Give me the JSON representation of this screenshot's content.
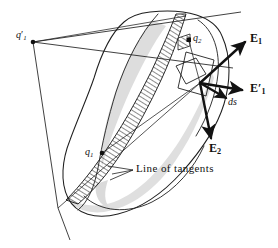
{
  "figure": {
    "kind": "geometric-diagram",
    "caption_text": "Line of tangents",
    "background_color": "#ffffff",
    "ink_color": "#1a1a1a",
    "shade_color": "#cccccc",
    "hatch_color": "#2a2a2a",
    "width": 278,
    "height": 248
  },
  "points": [
    {
      "id": "q1prime",
      "base": "q",
      "subscript": "1",
      "prime": "′",
      "label": "q′1",
      "x": 30,
      "y": 36,
      "marker": "filled-dot",
      "marker_x": 32,
      "marker_y": 42
    },
    {
      "id": "q2",
      "base": "q",
      "subscript": "2",
      "prime": "",
      "label": "q2",
      "x": 196,
      "y": 38,
      "marker": "filled-square",
      "marker_x": 189,
      "marker_y": 40
    },
    {
      "id": "q1",
      "base": "q",
      "subscript": "1",
      "prime": "",
      "label": "q1",
      "x": 88,
      "y": 150,
      "marker": "filled-dot",
      "marker_x": 102,
      "marker_y": 153
    }
  ],
  "vectors": [
    {
      "id": "E1",
      "base": "E",
      "subscript": "1",
      "prime": "",
      "label": "E1",
      "label_x": 252,
      "label_y": 38,
      "from_x": 200,
      "from_y": 83,
      "to_x": 247,
      "to_y": 43
    },
    {
      "id": "E1prime",
      "base": "E",
      "subscript": "1",
      "prime": "′",
      "label": "E′1",
      "label_x": 252,
      "label_y": 88,
      "from_x": 200,
      "from_y": 83,
      "to_x": 244,
      "to_y": 91
    },
    {
      "id": "ds",
      "base": "ds",
      "subscript": "",
      "prime": "",
      "label": "ds",
      "label_x": 231,
      "label_y": 103,
      "from_x": 200,
      "from_y": 83,
      "to_x": 228,
      "to_y": 99
    },
    {
      "id": "E2",
      "base": "E",
      "subscript": "2",
      "prime": "",
      "label": "E2",
      "label_x": 212,
      "label_y": 148,
      "from_x": 200,
      "from_y": 83,
      "to_x": 212,
      "to_y": 140
    }
  ],
  "annotations": [
    {
      "id": "line-of-tangents",
      "text": "Line of tangents",
      "x": 136,
      "y": 166,
      "leader_from_x": 133,
      "leader_from_y": 170,
      "leader_to_x": 112,
      "leader_to_y": 174
    }
  ]
}
